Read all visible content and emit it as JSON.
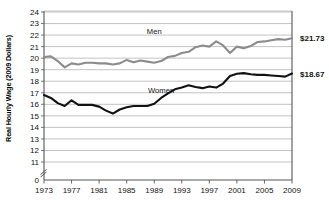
{
  "chart_data": {
    "type": "line",
    "title": "",
    "xlabel": "",
    "ylabel": "Real Hourly Wage (2009 Dollars)",
    "x": [
      1973,
      1974,
      1975,
      1976,
      1977,
      1978,
      1979,
      1980,
      1981,
      1982,
      1983,
      1984,
      1985,
      1986,
      1987,
      1988,
      1989,
      1990,
      1991,
      1992,
      1993,
      1994,
      1995,
      1996,
      1997,
      1998,
      1999,
      2000,
      2001,
      2002,
      2003,
      2004,
      2005,
      2006,
      2007,
      2008,
      2009
    ],
    "xlim": [
      1973,
      2009
    ],
    "ylim": [
      11,
      24
    ],
    "y_break_from": 0,
    "y_break_to": 11,
    "ytick_labels": [
      "0",
      "11",
      "12",
      "13",
      "14",
      "15",
      "16",
      "17",
      "18",
      "19",
      "20",
      "21",
      "22",
      "23",
      "24"
    ],
    "xtick_labels": [
      "1973",
      "1977",
      "1981",
      "1985",
      "1989",
      "1993",
      "1997",
      "2001",
      "2005",
      "2009"
    ],
    "xticks": [
      1973,
      1977,
      1981,
      1985,
      1989,
      1993,
      1997,
      2001,
      2005,
      2009
    ],
    "grid": true,
    "legend": "inline-annotation",
    "series": [
      {
        "name": "Men",
        "color": "#8c8c8c",
        "label_x": 1989,
        "label_y": 22.1,
        "end_label": "$21.73",
        "end_value": 21.73,
        "values": [
          20.1,
          20.15,
          19.75,
          19.2,
          19.55,
          19.45,
          19.6,
          19.6,
          19.55,
          19.55,
          19.45,
          19.55,
          19.85,
          19.65,
          19.8,
          19.7,
          19.6,
          19.75,
          20.1,
          20.2,
          20.45,
          20.55,
          20.95,
          21.1,
          21.0,
          21.45,
          21.1,
          20.45,
          21.0,
          20.85,
          21.05,
          21.4,
          21.45,
          21.55,
          21.65,
          21.6,
          21.73
        ]
      },
      {
        "name": "Women",
        "color": "#111111",
        "label_x": 1990,
        "label_y": 17.0,
        "end_label": "$18.67",
        "end_value": 18.67,
        "values": [
          16.8,
          16.55,
          16.1,
          15.85,
          16.35,
          15.95,
          15.95,
          15.95,
          15.8,
          15.45,
          15.2,
          15.55,
          15.75,
          15.85,
          15.85,
          15.85,
          16.05,
          16.55,
          16.95,
          17.3,
          17.45,
          17.65,
          17.5,
          17.4,
          17.55,
          17.45,
          17.8,
          18.45,
          18.65,
          18.7,
          18.6,
          18.55,
          18.55,
          18.5,
          18.45,
          18.4,
          18.67
        ]
      }
    ]
  },
  "axis": {
    "break_marker": "axis-break"
  }
}
